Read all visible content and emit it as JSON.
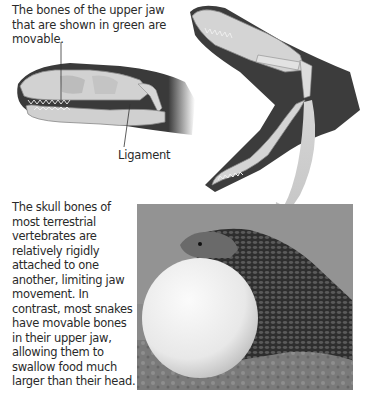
{
  "figure": {
    "top_caption": "The bones of the upper jaw that are shown in green are movable.",
    "ligament_label": "Ligament",
    "body_caption": "The skull bones of most terrestrial vertebrates are relatively rigidly attached to one another, limiting jaw movement. In contrast, most snakes have movable bones in their upper jaw, allowing them to swallow food much larger than their head.",
    "panels": [
      {
        "name": "snake-skull-closed",
        "description": "Snake head with jaw closed showing skull bones"
      },
      {
        "name": "snake-skull-open",
        "description": "Snake head with jaw wide open showing movable upper jaw bones"
      },
      {
        "name": "snake-eating-egg-photo",
        "description": "Photo of snake swallowing a large egg"
      }
    ]
  }
}
